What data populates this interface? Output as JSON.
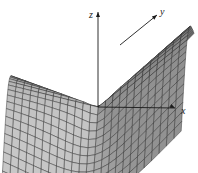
{
  "figure": {
    "type": "3d-surface-mesh",
    "axes": [
      {
        "name": "x",
        "label": "x"
      },
      {
        "name": "y",
        "label": "y"
      },
      {
        "name": "z",
        "label": "z"
      }
    ],
    "surface": {
      "description": "Mesh surface with a singular point at the origin",
      "function": "z = (x^2 - y^2) / sqrt(x^2 + y^2)",
      "x_range": [
        -1,
        1
      ],
      "y_range": [
        -1,
        1
      ],
      "grid_divisions": 24,
      "fill_color": "#9a9a9a",
      "mesh_color": "#2a2a2a"
    }
  }
}
